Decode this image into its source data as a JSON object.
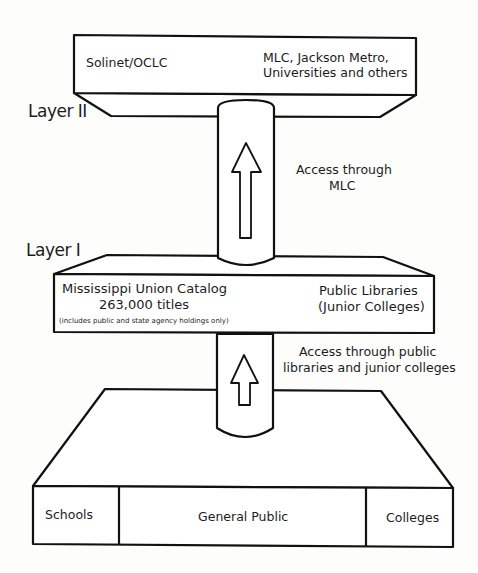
{
  "layers": {
    "layer2": {
      "label": "Layer II",
      "left_text": "Solinet/OCLC",
      "right_text_line1": "MLC, Jackson Metro,",
      "right_text_line2": "Universities and others"
    },
    "access_layer2": {
      "line1": "Access through",
      "line2": "MLC",
      "icon": "arrow-up-icon"
    },
    "layer1": {
      "label": "Layer I",
      "left_line1": "Mississippi Union Catalog",
      "left_line2": "263,000 titles",
      "left_note": "(includes public and state agency holdings only)",
      "right_line1": "Public Libraries",
      "right_line2": "(Junior Colleges)"
    },
    "access_layer1": {
      "line1": "Access through public",
      "line2": "libraries and junior colleges",
      "icon": "arrow-up-icon"
    },
    "base": {
      "segments": [
        {
          "label": "Schools"
        },
        {
          "label": "General Public"
        },
        {
          "label": "Colleges"
        }
      ]
    }
  },
  "colors": {
    "line": "#111111",
    "fill": "#ffffff",
    "background": "#fdfdfb"
  }
}
